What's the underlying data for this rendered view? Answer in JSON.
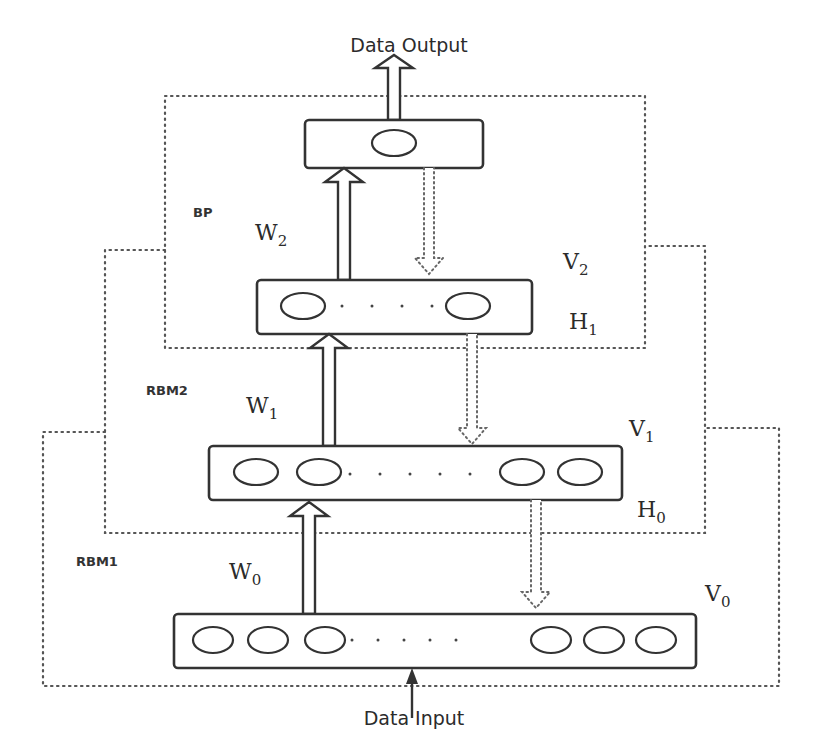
{
  "diagram": {
    "io": {
      "output_label": "Data Output",
      "input_label": "Data Input"
    },
    "regions": [
      {
        "id": "bp",
        "label": "BP"
      },
      {
        "id": "rbm2",
        "label": "RBM2"
      },
      {
        "id": "rbm1",
        "label": "RBM1"
      }
    ],
    "layers": [
      {
        "id": "output",
        "units_visible": 1,
        "ellipsis": false
      },
      {
        "id": "h1",
        "units_left": 1,
        "units_right": 1,
        "ellipsis": true,
        "labels": {
          "top": {
            "base": "V",
            "sub": "2"
          },
          "bottom": {
            "base": "H",
            "sub": "1"
          }
        }
      },
      {
        "id": "h0",
        "units_left": 2,
        "units_right": 2,
        "ellipsis": true,
        "labels": {
          "top": {
            "base": "V",
            "sub": "1"
          },
          "bottom": {
            "base": "H",
            "sub": "0"
          }
        }
      },
      {
        "id": "v0",
        "units_left": 3,
        "units_right": 3,
        "ellipsis": true,
        "labels": {
          "top": {
            "base": "V",
            "sub": "0"
          }
        }
      }
    ],
    "weights": [
      {
        "id": "w2",
        "base": "W",
        "sub": "2"
      },
      {
        "id": "w1",
        "base": "W",
        "sub": "1"
      },
      {
        "id": "w0",
        "base": "W",
        "sub": "0"
      }
    ],
    "arrows": {
      "forward_style": "solid hollow up-arrow",
      "reconstruction_style": "dotted hollow down-arrow"
    }
  }
}
